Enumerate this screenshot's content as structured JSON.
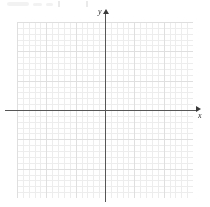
{
  "figure": {
    "kind": "blank-cartesian-grid",
    "background_color": "#ffffff"
  },
  "axes": {
    "x": {
      "label": "x",
      "arrow_icon": "arrow-right-icon",
      "color": "#565656",
      "origin_px": 105
    },
    "y": {
      "label": "y",
      "arrow_icon": "arrow-up-icon",
      "color": "#565656",
      "origin_px": 110
    }
  },
  "grid": {
    "minor_color": "#d8d8d8",
    "major_color": "#b9b9b9",
    "minor_cells_per_major": 5,
    "style": "dotted",
    "columns_major": 6,
    "rows_major": 6
  },
  "chart_data": {
    "type": "scatter",
    "title": "",
    "xlabel": "x",
    "ylabel": "y",
    "series": [],
    "x": [],
    "values": [],
    "grid": true,
    "legend": "none",
    "xlim": [
      -15,
      15
    ],
    "ylim": [
      -15,
      15
    ]
  }
}
